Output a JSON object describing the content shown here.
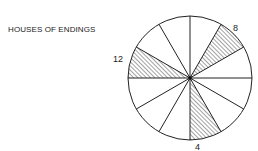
{
  "title": "HOUSES OF ENDINGS",
  "diagram": {
    "type": "wheel",
    "segments": 12,
    "shaded_houses": [
      "4",
      "8",
      "12"
    ],
    "labels": {
      "house_8": "8",
      "house_12": "12",
      "house_4": "4"
    },
    "colors": {
      "line": "#222222",
      "background": "#ffffff"
    }
  }
}
